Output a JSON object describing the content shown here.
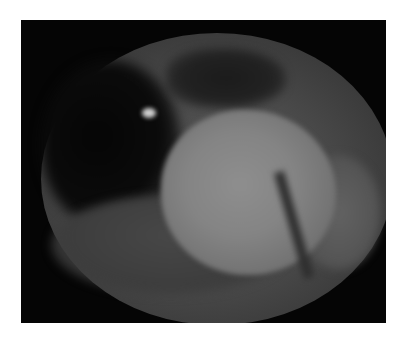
{
  "image": {
    "description": "Grayscale endoscopic view showing a rounded pale mass within a circular field of view on a black background",
    "alt_text": "Endoscopic image of a rounded lesion",
    "colors": {
      "page_background": "#ffffff",
      "frame_background": "#050505",
      "field_mid": "#4a4a4a",
      "lesion_center": "#8e8e8e",
      "highlight": "#cfcfcf"
    }
  }
}
